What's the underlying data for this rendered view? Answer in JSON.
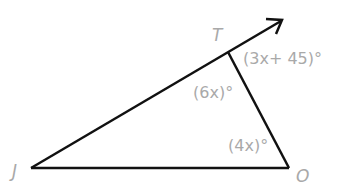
{
  "diagram": {
    "type": "triangle-exterior-angle",
    "vertices": [
      {
        "name": "J",
        "x": 31,
        "y": 168
      },
      {
        "name": "T",
        "x": 228,
        "y": 52
      },
      {
        "name": "O",
        "x": 289,
        "y": 168
      }
    ],
    "ray": {
      "from": "J",
      "through": "T",
      "tip": {
        "x": 282,
        "y": 20
      }
    },
    "angle_labels": {
      "exterior_T": "(3x+ 45)°",
      "interior_T": "(6x)°",
      "interior_O": "(4x)°"
    },
    "colors": {
      "line": "#111111",
      "label": "#a9a9a9"
    }
  }
}
